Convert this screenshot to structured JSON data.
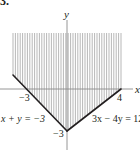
{
  "problem_number": "33.",
  "chart_data": {
    "type": "area",
    "title": "",
    "xlabel": "x",
    "ylabel": "y",
    "xlim": [
      -5,
      5
    ],
    "ylim": [
      -4.2,
      6.5
    ],
    "grid": false,
    "region": {
      "description": "Shaded feasible region above both boundary lines",
      "shading": "vertical-hatch",
      "x_range": [
        -4,
        4
      ],
      "top_y": 4,
      "polygon": [
        [
          -4,
          4
        ],
        [
          -4,
          1
        ],
        [
          0,
          -3
        ],
        [
          4,
          0
        ],
        [
          4,
          4
        ]
      ]
    },
    "lines": [
      {
        "name": "x + y = -3",
        "equation": "x + y = -3",
        "points": [
          [
            -4,
            1
          ],
          [
            0,
            -3
          ]
        ]
      },
      {
        "name": "3x - 4y = 12",
        "equation": "3x − 4y = 12",
        "points": [
          [
            0,
            -3
          ],
          [
            4,
            0
          ]
        ]
      }
    ],
    "tick_labels": [
      {
        "axis": "x",
        "value": -3,
        "label": "−3"
      },
      {
        "axis": "x",
        "value": 4,
        "label": "4"
      },
      {
        "axis": "y",
        "value": -3,
        "label": "−3"
      }
    ],
    "annotations": [
      {
        "text": "x + y = −3",
        "near": "left-line"
      },
      {
        "text": "3x − 4y = 12",
        "near": "right-line"
      }
    ]
  },
  "colors": {
    "ink": "#231f20",
    "hatch": "#9a9a9a",
    "axis": "#8a8a8a"
  }
}
